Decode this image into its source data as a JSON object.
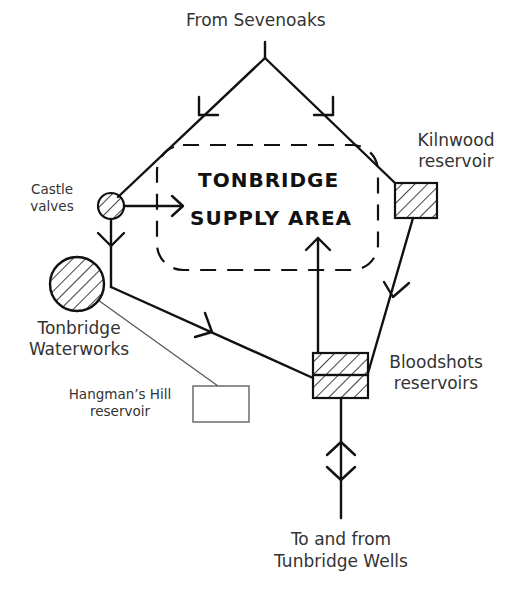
{
  "diagram": {
    "supply_area": {
      "line1": "TONBRIDGE",
      "line2": "SUPPLY AREA"
    },
    "nodes": {
      "sevenoaks": "From Sevenoaks",
      "castle_valves": {
        "line1": "Castle",
        "line2": "valves"
      },
      "waterworks": {
        "line1": "Tonbridge",
        "line2": "Waterworks"
      },
      "kilnwood": {
        "line1": "Kilnwood",
        "line2": "reservoir"
      },
      "bloodshots": {
        "line1": "Bloodshots",
        "line2": "reservoirs"
      },
      "hangmans_hill": {
        "line1": "Hangman’s Hill",
        "line2": "reservoir"
      },
      "tunbridge_wells": {
        "line1": "To and from",
        "line2": "Tunbridge Wells"
      }
    },
    "flows": [
      {
        "from": "Sevenoaks",
        "to": "Castle valves",
        "direction": "one-way"
      },
      {
        "from": "Sevenoaks",
        "to": "Kilnwood reservoir",
        "direction": "one-way"
      },
      {
        "from": "Castle valves",
        "to": "Tonbridge Supply Area",
        "direction": "one-way"
      },
      {
        "from": "Castle valves",
        "to": "Tonbridge Waterworks",
        "direction": "one-way"
      },
      {
        "from": "Tonbridge Waterworks",
        "to": "Bloodshots reservoirs",
        "direction": "one-way"
      },
      {
        "from": "Kilnwood reservoir",
        "to": "Bloodshots reservoirs",
        "direction": "one-way"
      },
      {
        "from": "Bloodshots reservoirs",
        "to": "Tonbridge Supply Area",
        "direction": "one-way"
      },
      {
        "from": "Bloodshots reservoirs",
        "to": "Tunbridge Wells",
        "direction": "two-way"
      },
      {
        "from": "Tonbridge Waterworks",
        "to": "Hangman's Hill reservoir",
        "direction": "link"
      }
    ],
    "colors": {
      "line": "#111111",
      "thin_line": "#555555",
      "text": "#333333"
    }
  }
}
